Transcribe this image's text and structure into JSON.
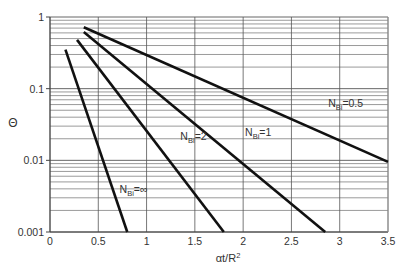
{
  "chart_data": {
    "type": "line",
    "title": "",
    "xlabel": "αt/R²",
    "ylabel": "Θ",
    "xlim": [
      0,
      3.5
    ],
    "ylim": [
      0.001,
      1
    ],
    "yscale": "log",
    "grid": true,
    "x_ticks": [
      "0",
      "0.5",
      "1",
      "1.5",
      "2",
      "2.5",
      "3",
      "3.5"
    ],
    "y_ticks": [
      "1",
      "0.1",
      "0.01",
      "0.001"
    ],
    "series": [
      {
        "name": "N_Bi=0.5",
        "label_main": "N",
        "label_sub": "Bi",
        "label_rest": "=0.5",
        "x": [
          0.35,
          3.5
        ],
        "y": [
          0.72,
          0.0095
        ]
      },
      {
        "name": "N_Bi=1",
        "label_main": "N",
        "label_sub": "Bi",
        "label_rest": "=1",
        "x": [
          0.35,
          2.85
        ],
        "y": [
          0.62,
          0.001
        ]
      },
      {
        "name": "N_Bi=2",
        "label_main": "N",
        "label_sub": "Bi",
        "label_rest": "=2",
        "x": [
          0.28,
          1.8
        ],
        "y": [
          0.48,
          0.001
        ]
      },
      {
        "name": "N_Bi=∞",
        "label_main": "N",
        "label_sub": "Bi",
        "label_rest": "=∞",
        "x": [
          0.16,
          0.8
        ],
        "y": [
          0.35,
          0.001
        ]
      }
    ],
    "annotations": [
      {
        "series": "N_Bi=0.5",
        "x": 2.88,
        "y": 0.056
      },
      {
        "series": "N_Bi=1",
        "x": 2.02,
        "y": 0.022
      },
      {
        "series": "N_Bi=2",
        "x": 1.35,
        "y": 0.019
      },
      {
        "series": "N_Bi=∞",
        "x": 0.72,
        "y": 0.0035
      }
    ]
  }
}
